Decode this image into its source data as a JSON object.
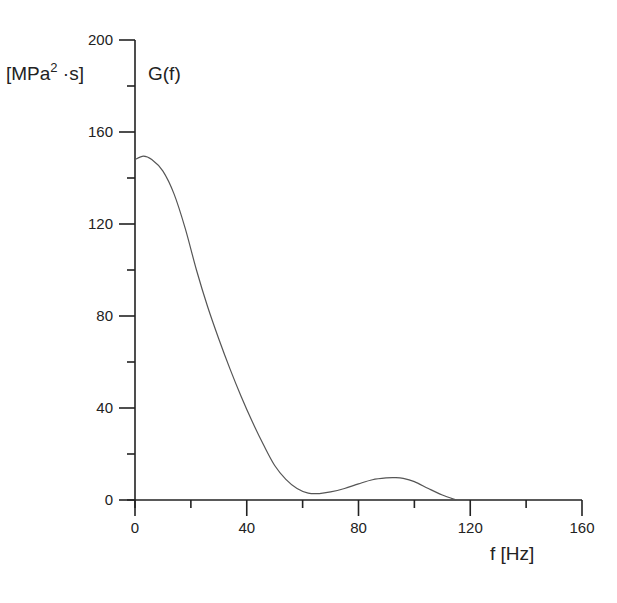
{
  "chart_data": {
    "type": "line",
    "title": "",
    "series_label": "G(f)",
    "xlabel": "f  [Hz]",
    "ylabel": "[MPa²·s]",
    "ylabel_parts": {
      "prefix": "[MPa",
      "sup": "2",
      "suffix": " ·s]"
    },
    "xlim": [
      0,
      160
    ],
    "ylim": [
      0,
      200
    ],
    "x_ticks": [
      0,
      40,
      80,
      120,
      160
    ],
    "y_ticks": [
      0,
      40,
      80,
      120,
      160,
      200
    ],
    "x_tick_labels": [
      "0",
      "40",
      "80",
      "120",
      "160"
    ],
    "y_tick_labels": [
      "0",
      "40",
      "80",
      "120",
      "160",
      "200"
    ],
    "minor_ticks": true,
    "grid": false,
    "legend": "none",
    "series": [
      {
        "name": "G(f)",
        "x": [
          0,
          3,
          6,
          10,
          14,
          18,
          22,
          26,
          30,
          34,
          38,
          42,
          46,
          50,
          54,
          58,
          62,
          66,
          70,
          75,
          80,
          85,
          90,
          93,
          96,
          100,
          105,
          110,
          115
        ],
        "y": [
          148,
          149.5,
          148,
          143,
          133,
          118,
          100,
          84,
          70,
          57,
          45,
          34,
          24,
          15,
          9,
          5,
          3,
          2.8,
          3.5,
          5,
          7,
          8.8,
          9.6,
          9.7,
          9.4,
          8,
          5,
          2.2,
          0
        ]
      }
    ]
  }
}
